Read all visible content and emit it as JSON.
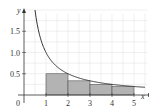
{
  "chart_data": {
    "type": "area",
    "title": "",
    "xlabel": "x",
    "ylabel": "y",
    "xlim": [
      0,
      5.6
    ],
    "ylim": [
      0,
      2.0
    ],
    "x_ticks": [
      1,
      2,
      3,
      4,
      5
    ],
    "x_tick_labels": [
      "1",
      "2",
      "3",
      "4",
      "5"
    ],
    "y_ticks": [
      0.5,
      1.0,
      1.5
    ],
    "y_tick_labels": [
      "0.5",
      "1.0",
      "1.5"
    ],
    "origin_label": "0",
    "grid": true,
    "curve": {
      "name": "y = 1/x",
      "x_from": 0.5,
      "x_to": 5.5
    },
    "rectangles": [
      {
        "x_start": 1,
        "x_end": 2,
        "height": 0.5
      },
      {
        "x_start": 2,
        "x_end": 3,
        "height": 0.3333
      },
      {
        "x_start": 3,
        "x_end": 4,
        "height": 0.25
      },
      {
        "x_start": 4,
        "x_end": 5,
        "height": 0.2
      }
    ],
    "colors": {
      "grid": "#e6e6e6",
      "rect_fill": "#b3b3b3",
      "rect_stroke": "#555555",
      "curve": "#333333",
      "axis": "#333333"
    }
  }
}
